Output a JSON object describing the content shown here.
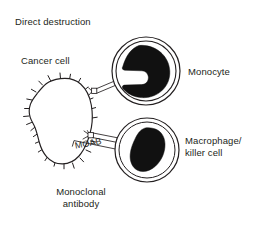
{
  "figure": {
    "title": "Direct destruction",
    "background_color": "#ffffff",
    "ink_color": "#231f20",
    "labels": {
      "title": "Direct destruction",
      "cancer_cell": "Cancer cell",
      "monocyte": "Monocyte",
      "macrophage_line1": "Macrophage/",
      "macrophage_line2": "killer cell",
      "moab": "MOAB",
      "antibody_line1": "Monoclonal",
      "antibody_line2": "antibody"
    },
    "elements": [
      {
        "name": "cancer-cell",
        "shape": "irregular-spiked-blob",
        "fill": "#ffffff",
        "stroke": "#231f20",
        "spike_count": 22,
        "center": [
          57,
          120
        ],
        "label": "Cancer cell"
      },
      {
        "name": "monocyte",
        "shape": "circle-with-horseshoe-nucleus",
        "fill": "#ffffff",
        "nucleus_fill": "#111111",
        "stroke": "#231f20",
        "center": [
          146,
          71
        ],
        "radius": 34,
        "label": "Monocyte"
      },
      {
        "name": "macrophage",
        "shape": "circle-with-bean-nucleus",
        "fill": "#ffffff",
        "nucleus_fill": "#111111",
        "stroke": "#231f20",
        "center": [
          147,
          150
        ],
        "radius": 32,
        "label": "Macrophage/ killer cell"
      },
      {
        "name": "antibody-upper",
        "shape": "double-line-linker",
        "from": [
          93,
          91
        ],
        "to": [
          118,
          81
        ],
        "label": ""
      },
      {
        "name": "antibody-lower",
        "shape": "double-line-linker",
        "from": [
          88,
          136
        ],
        "to": [
          119,
          142
        ],
        "label": "MOAB"
      }
    ]
  }
}
